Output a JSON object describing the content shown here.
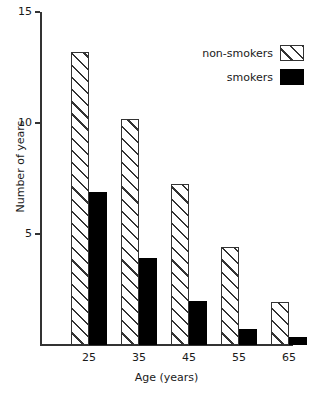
{
  "chart_data": {
    "type": "bar",
    "title": "",
    "xlabel": "Age (years)",
    "ylabel": "Number of years",
    "categories": [
      "25",
      "35",
      "45",
      "55",
      "65"
    ],
    "series": [
      {
        "name": "non-smokers",
        "fill": "hatched",
        "color": "#333333",
        "values": [
          13.2,
          10.2,
          7.25,
          4.4,
          1.95
        ]
      },
      {
        "name": "smokers",
        "fill": "solid",
        "color": "#000000",
        "values": [
          6.9,
          3.9,
          2.0,
          0.7,
          0.35
        ]
      }
    ],
    "ylim": [
      0,
      15
    ],
    "yticks": [
      5,
      10,
      15
    ],
    "ytick_labels": [
      "5",
      "10",
      "15"
    ],
    "grid": false,
    "legend_position": "top-right"
  },
  "legend": {
    "entries": [
      {
        "label": "non-smokers"
      },
      {
        "label": "smokers"
      }
    ]
  },
  "axes": {
    "y_title": "Number of years",
    "x_title": "Age (years)",
    "y_tick_labels": [
      "5",
      "10",
      "15"
    ],
    "x_tick_labels": [
      "25",
      "35",
      "45",
      "55",
      "65"
    ]
  }
}
